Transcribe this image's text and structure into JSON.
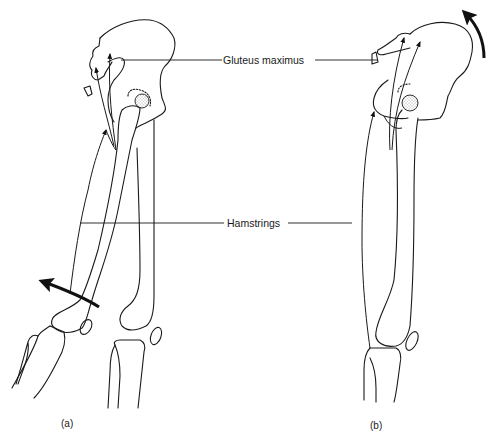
{
  "figure": {
    "type": "anatomical-diagram",
    "stroke_color": "#1a1a1a",
    "background": "#ffffff"
  },
  "labels": {
    "gluteus": "Gluteus maximus",
    "hamstrings": "Hamstrings"
  },
  "panels": [
    {
      "id": "a",
      "caption": "(a)",
      "rotation_arrow": "counter-clockwise at knee (leg flexion)"
    },
    {
      "id": "b",
      "caption": "(b)",
      "rotation_arrow": "counter-clockwise at pelvis (posterior pelvic tilt)"
    }
  ]
}
